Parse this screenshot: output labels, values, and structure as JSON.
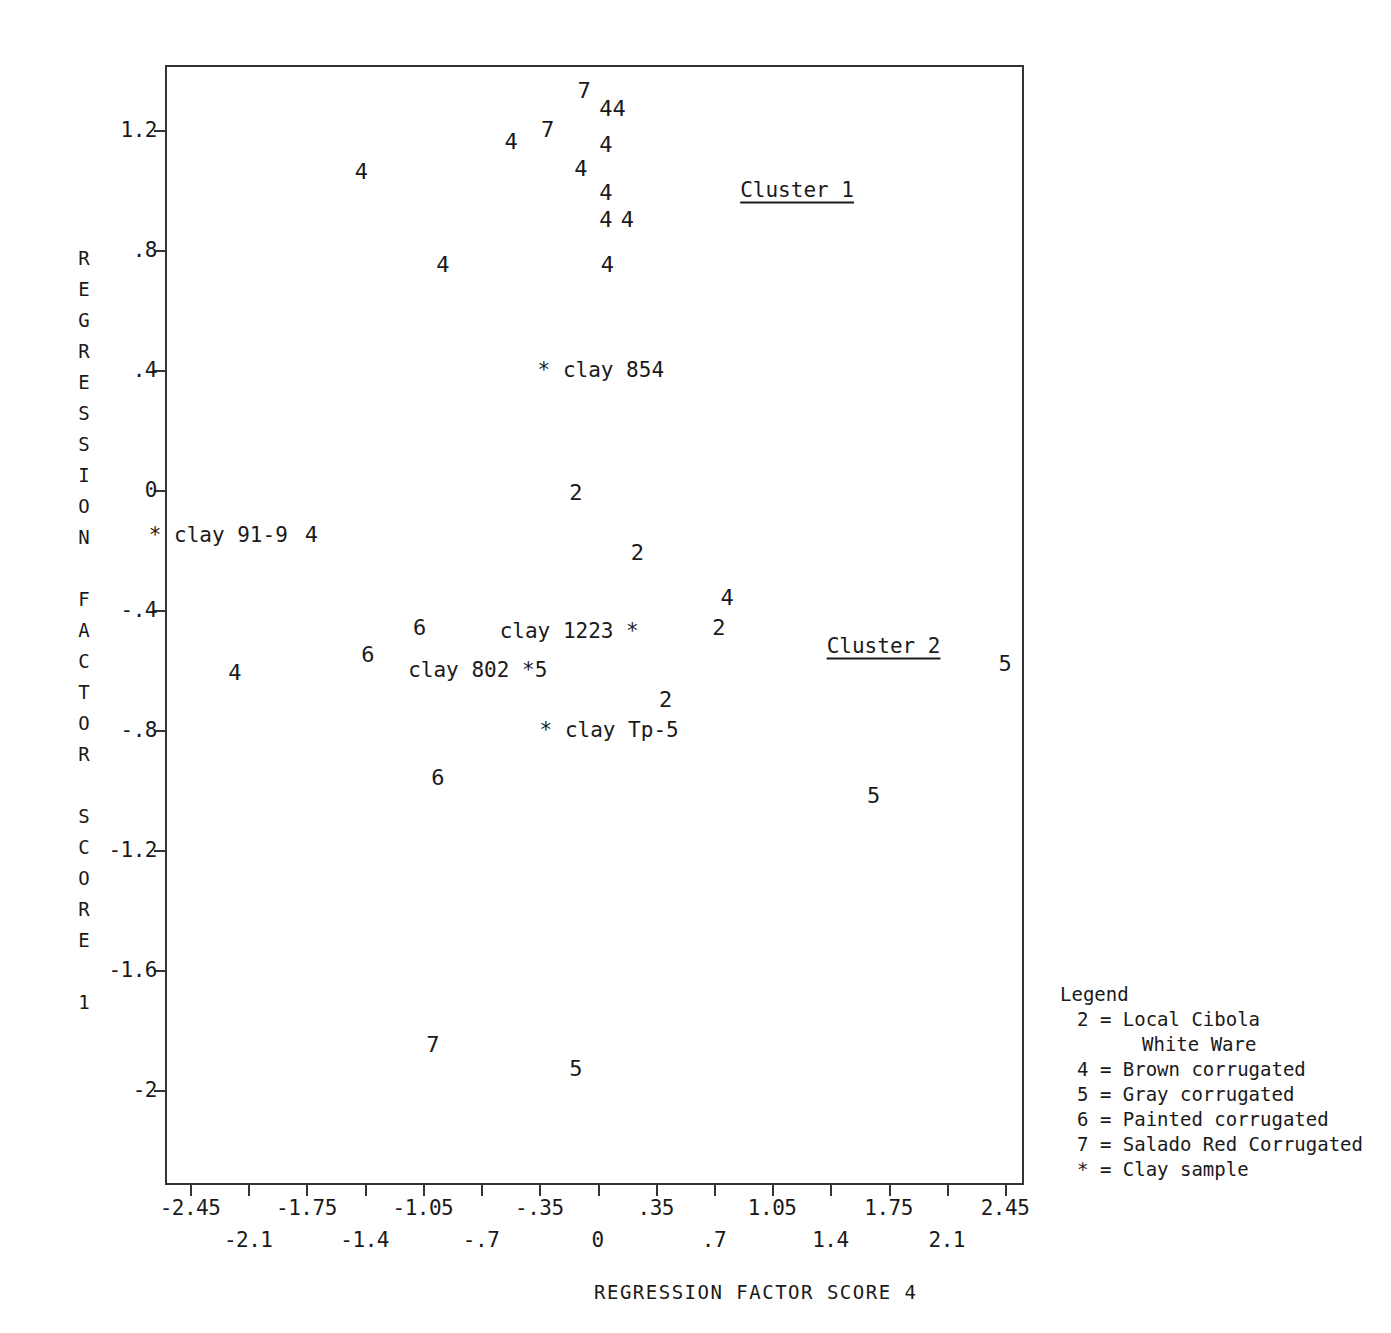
{
  "chart_data": {
    "type": "scatter",
    "title": "",
    "xlabel": "REGRESSION FACTOR SCORE 4",
    "ylabel": "REGRESSION FACTOR SCORE 1",
    "xlim": [
      -2.8,
      2.8
    ],
    "ylim": [
      -2.25,
      1.45
    ],
    "grid": false,
    "legend_position": "right-bottom",
    "x_ticks_row1": [
      "-2.45",
      "-1.75",
      "-1.05",
      "-.35",
      ".35",
      "1.05",
      "1.75",
      "2.45"
    ],
    "x_ticks_row1_values": [
      -2.45,
      -1.75,
      -1.05,
      -0.35,
      0.35,
      1.05,
      1.75,
      2.45
    ],
    "x_ticks_row2": [
      "-2.1",
      "-1.4",
      "-.7",
      "0",
      ".7",
      "1.4",
      "2.1"
    ],
    "x_ticks_row2_values": [
      -2.1,
      -1.4,
      -0.7,
      0,
      0.7,
      1.4,
      2.1
    ],
    "y_ticks": [
      "1.2",
      ".8",
      ".4",
      "0",
      "-.4",
      "-.8",
      "-1.2",
      "-1.6",
      "-2"
    ],
    "y_ticks_values": [
      1.2,
      0.8,
      0.4,
      0,
      -0.4,
      -0.8,
      -1.2,
      -1.6,
      -2.0
    ],
    "points": [
      {
        "label": "7",
        "x": -0.08,
        "y": 1.33
      },
      {
        "label": "4",
        "x": 0.05,
        "y": 1.27
      },
      {
        "label": "4",
        "x": 0.13,
        "y": 1.27
      },
      {
        "label": "7",
        "x": -0.3,
        "y": 1.2
      },
      {
        "label": "4",
        "x": -0.52,
        "y": 1.16
      },
      {
        "label": "4",
        "x": 0.05,
        "y": 1.15
      },
      {
        "label": "4",
        "x": -0.1,
        "y": 1.07
      },
      {
        "label": "4",
        "x": -1.42,
        "y": 1.06
      },
      {
        "label": "4",
        "x": 0.05,
        "y": 0.99
      },
      {
        "label": "4",
        "x": 0.05,
        "y": 0.9
      },
      {
        "label": "4",
        "x": 0.18,
        "y": 0.9
      },
      {
        "label": "4",
        "x": -0.93,
        "y": 0.75
      },
      {
        "label": "4",
        "x": 0.06,
        "y": 0.75
      },
      {
        "label": "2",
        "x": -0.13,
        "y": -0.01
      },
      {
        "label": "4",
        "x": -1.72,
        "y": -0.15
      },
      {
        "label": "2",
        "x": 0.24,
        "y": -0.21
      },
      {
        "label": "4",
        "x": 0.78,
        "y": -0.36
      },
      {
        "label": "2",
        "x": 0.73,
        "y": -0.46
      },
      {
        "label": "6",
        "x": -1.07,
        "y": -0.46
      },
      {
        "label": "5",
        "x": 2.45,
        "y": -0.58
      },
      {
        "label": "6",
        "x": -1.38,
        "y": -0.55
      },
      {
        "label": "4",
        "x": -2.18,
        "y": -0.61
      },
      {
        "label": "2",
        "x": 0.41,
        "y": -0.7
      },
      {
        "label": "6",
        "x": -0.96,
        "y": -0.96
      },
      {
        "label": "5",
        "x": 1.66,
        "y": -1.02
      },
      {
        "label": "7",
        "x": -0.99,
        "y": -1.85
      },
      {
        "label": "5",
        "x": -0.13,
        "y": -1.93
      }
    ],
    "annotations": [
      {
        "text": "Cluster 1",
        "x": 1.2,
        "y": 1.0,
        "style": "underline"
      },
      {
        "text": "* clay 854",
        "x": 0.02,
        "y": 0.4,
        "style": "plain"
      },
      {
        "text": "* clay 91-9",
        "x": -2.28,
        "y": -0.15,
        "style": "plain"
      },
      {
        "text": "clay 1223  *",
        "x": -0.17,
        "y": -0.47,
        "style": "plain"
      },
      {
        "text": "Cluster 2",
        "x": 1.72,
        "y": -0.52,
        "style": "underline"
      },
      {
        "text": "clay 802 *5",
        "x": -0.72,
        "y": -0.6,
        "style": "plain"
      },
      {
        "text": "* clay Tp-5",
        "x": 0.07,
        "y": -0.8,
        "style": "plain"
      }
    ],
    "legend": {
      "title": "Legend",
      "entries": [
        {
          "key": "2",
          "desc": "Local Cibola",
          "cont": "White Ware"
        },
        {
          "key": "4",
          "desc": "Brown corrugated",
          "cont": ""
        },
        {
          "key": "5",
          "desc": "Gray corrugated",
          "cont": ""
        },
        {
          "key": "6",
          "desc": "Painted corrugated",
          "cont": ""
        },
        {
          "key": "7",
          "desc": "Salado Red Corrugated",
          "cont": ""
        },
        {
          "key": "*",
          "desc": "Clay sample",
          "cont": ""
        }
      ]
    }
  },
  "colors": {
    "ink": "#1a1a1a",
    "axis": "#333333",
    "background": "#ffffff"
  }
}
